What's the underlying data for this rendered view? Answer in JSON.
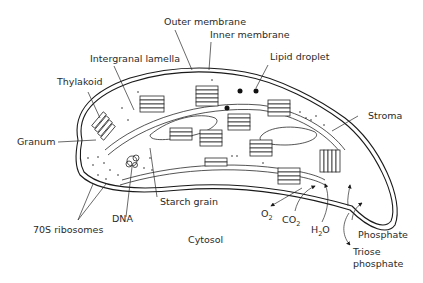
{
  "diagram": {
    "labels": {
      "outer_membrane": "Outer membrane",
      "inner_membrane": "Inner membrane",
      "lipid_droplet": "Lipid droplet",
      "intergranal_lamella": "Intergranal lamella",
      "thylakoid": "Thylakoid",
      "stroma": "Stroma",
      "granum": "Granum",
      "dna": "DNA",
      "starch_grain": "Starch grain",
      "ribosomes": "70S ribosomes",
      "cytosol": "Cytosol",
      "o2": "O",
      "o2_sub": "2",
      "co2": "CO",
      "co2_sub": "2",
      "h2o_h": "H",
      "h2o_sub": "2",
      "h2o_o": "O",
      "phosphate": "Phosphate",
      "triose_line1": "Triose",
      "triose_line2": "phosphate"
    },
    "colors": {
      "line": "#1a1a1a",
      "text": "#2a2a2a",
      "background": "#ffffff"
    }
  }
}
